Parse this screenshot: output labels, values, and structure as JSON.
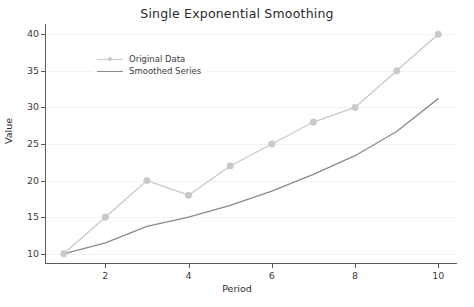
{
  "chart_data": {
    "type": "line",
    "title": "Single Exponential Smoothing",
    "xlabel": "Period",
    "ylabel": "Value",
    "x": [
      1,
      2,
      3,
      4,
      5,
      6,
      7,
      8,
      9,
      10
    ],
    "xlim": [
      0.55,
      10.45
    ],
    "ylim": [
      8.6,
      41.4
    ],
    "xticks": [
      2,
      4,
      6,
      8,
      10
    ],
    "xtick_labels": [
      "2",
      "4",
      "6",
      "8",
      "10"
    ],
    "yticks": [
      10,
      15,
      20,
      25,
      30,
      35,
      40
    ],
    "ytick_labels": [
      "10",
      "15",
      "20",
      "25",
      "30",
      "35",
      "40"
    ],
    "grid": true,
    "grid_axis": "y",
    "legend_position": "upper left",
    "series": [
      {
        "name": "Original Data",
        "values": [
          10,
          15,
          20,
          18,
          22,
          25,
          28,
          30,
          35,
          40
        ],
        "color": "#c9c9c9",
        "marker": "o",
        "marker_size": 3.2,
        "line_width": 1.3
      },
      {
        "name": "Smoothed Series",
        "values": [
          10,
          11.5,
          13.75,
          15.0,
          16.6,
          18.55,
          20.85,
          23.4,
          26.7,
          31.2
        ],
        "color": "#8a8a8a",
        "marker": "none",
        "marker_size": 0,
        "line_width": 1.3
      }
    ]
  },
  "colors": {
    "background": "#ffffff",
    "axis": "#5a5a5a",
    "grid": "#f2f2f2",
    "text": "#2b2b2b",
    "tick_text": "#3c3c3c",
    "original_data": "#c9c9c9",
    "smoothed_series": "#8a8a8a"
  }
}
